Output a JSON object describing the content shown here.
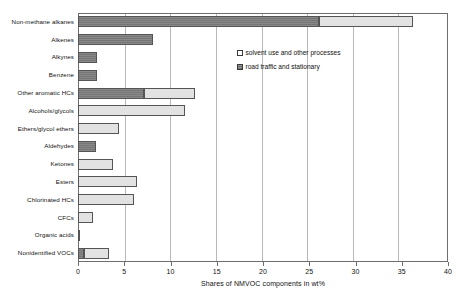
{
  "chart_data": {
    "type": "bar",
    "orientation": "horizontal",
    "stacked": true,
    "title": "",
    "xlabel": "Shares of NMVOC components in wt%",
    "ylabel": "",
    "xlim": [
      0,
      40
    ],
    "xticks": [
      0,
      5,
      10,
      15,
      20,
      25,
      30,
      35,
      40
    ],
    "xtick_labels": [
      "0",
      "5",
      "10",
      "15",
      "20",
      "25",
      "30",
      "35",
      "40"
    ],
    "grid": "vertical",
    "legend_position": "upper-right-inside",
    "categories": [
      "Non-methane alkanes",
      "Alkenes",
      "Alkynes",
      "Benzene",
      "Other aromatic HCs",
      "Alcohols/glycols",
      "Ethers/glycol ethers",
      "Aldehydes",
      "Ketones",
      "Esters",
      "Chlorinated HCs",
      "CFCs",
      "Organic acids",
      "Nonidentified VOCs"
    ],
    "series": [
      {
        "name": "road traffic and stationary",
        "color": "#7c7c7c",
        "values": [
          26.0,
          8.1,
          2.0,
          2.1,
          7.1,
          0.0,
          0.0,
          1.9,
          0.0,
          0.0,
          0.0,
          0.0,
          0.2,
          0.6
        ]
      },
      {
        "name": "solvent use and other processes",
        "color": "#e2e2e2",
        "values": [
          10.2,
          0.0,
          0.0,
          0.0,
          5.5,
          11.6,
          4.4,
          0.0,
          3.8,
          6.4,
          6.1,
          1.6,
          0.0,
          2.8
        ]
      }
    ],
    "totals": [
      36.2,
      8.1,
      2.0,
      2.1,
      12.6,
      11.6,
      4.4,
      1.9,
      3.8,
      6.4,
      6.1,
      1.6,
      0.2,
      3.4
    ]
  },
  "legend": {
    "items": [
      {
        "label": "solvent use and other processes",
        "swatch": "light"
      },
      {
        "label": "road traffic and stationary",
        "swatch": "dark"
      }
    ]
  },
  "axis": {
    "x_title": "Shares of NMVOC components in wt%"
  }
}
